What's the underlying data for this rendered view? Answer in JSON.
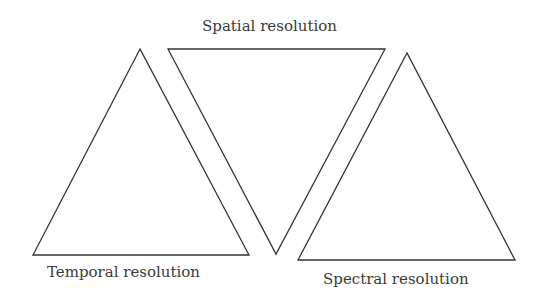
{
  "diagram": {
    "labels": {
      "spatial": "Spatial resolution",
      "temporal": "Temporal resolution",
      "spectral": "Spectral resolution"
    },
    "stroke_color": "#333333",
    "text_color": "#3a3a3a",
    "triangles": [
      {
        "name": "temporal",
        "orientation": "up",
        "points": [
          [
            140,
            49
          ],
          [
            33,
            255
          ],
          [
            249,
            255
          ]
        ]
      },
      {
        "name": "spatial",
        "orientation": "down",
        "points": [
          [
            168,
            49
          ],
          [
            385,
            49
          ],
          [
            276,
            254
          ]
        ]
      },
      {
        "name": "spectral",
        "orientation": "up",
        "points": [
          [
            407,
            53
          ],
          [
            298,
            260
          ],
          [
            515,
            260
          ]
        ]
      }
    ]
  }
}
